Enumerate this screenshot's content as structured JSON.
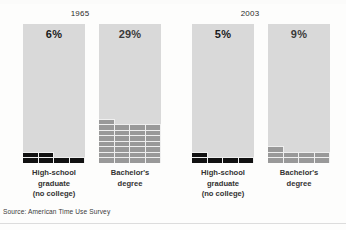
{
  "figure": {
    "source_note": "Source: American Time Use Survey",
    "colors": {
      "empty_cell": "#d9d9d9",
      "highschool_fill": "#111111",
      "bachelor_fill": "#999999",
      "background": "#fdfdfc",
      "text": "#2b2b2b"
    }
  },
  "panels": [
    {
      "year": "1965",
      "bars": [
        {
          "id": "hs-1965",
          "value_label": "6%",
          "value": 6,
          "category": "High-school\ngraduate\n(no college)",
          "category_lines": [
            "High-school",
            "graduate",
            "(no college)"
          ],
          "series": "highschool"
        },
        {
          "id": "ba-1965",
          "value_label": "29%",
          "value": 29,
          "category": "Bachelor's\ndegree",
          "category_lines": [
            "Bachelor's",
            "degree"
          ],
          "series": "bachelor"
        }
      ]
    },
    {
      "year": "2003",
      "bars": [
        {
          "id": "hs-2003",
          "value_label": "5%",
          "value": 5,
          "category": "High-school\ngraduate\n(no college)",
          "category_lines": [
            "High-school",
            "graduate",
            "(no college)"
          ],
          "series": "highschool"
        },
        {
          "id": "ba-2003",
          "value_label": "9%",
          "value": 9,
          "category": "Bachelor's\ndegree",
          "category_lines": [
            "Bachelor's",
            "degree"
          ],
          "series": "bachelor"
        }
      ]
    }
  ],
  "chart_data": {
    "type": "bar",
    "title": "",
    "subtitle": "",
    "xlabel": "",
    "ylabel": "",
    "ylim": [
      0,
      100
    ],
    "grid": true,
    "legend_position": "none",
    "units": "percent",
    "note": "Waffle-style bars: each bar is a 100-cell grid (4 columns x 25 rows) filled from the bottom; one cell = 1 percent.",
    "cells_per_row": 4,
    "total_cells": 100,
    "panels": [
      "1965",
      "2003"
    ],
    "categories": [
      "High-school graduate (no college)",
      "Bachelor's degree"
    ],
    "series": [
      {
        "name": "1965",
        "values": [
          6,
          29
        ]
      },
      {
        "name": "2003",
        "values": [
          5,
          9
        ]
      }
    ],
    "annotations": [
      "6%",
      "29%",
      "5%",
      "9%"
    ],
    "source": "Source: American Time Use Survey"
  }
}
